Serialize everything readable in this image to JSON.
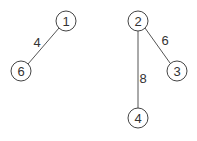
{
  "graph": {
    "nodes": [
      {
        "id": "1",
        "label": "1",
        "x": 66,
        "y": 21
      },
      {
        "id": "6",
        "label": "6",
        "x": 21,
        "y": 71
      },
      {
        "id": "2",
        "label": "2",
        "x": 138,
        "y": 21
      },
      {
        "id": "3",
        "label": "3",
        "x": 177,
        "y": 71
      },
      {
        "id": "4",
        "label": "4",
        "x": 138,
        "y": 118
      }
    ],
    "edges": [
      {
        "from": "1",
        "to": "6",
        "weight": "4",
        "lx": 37,
        "ly": 42
      },
      {
        "from": "2",
        "to": "3",
        "weight": "6",
        "lx": 165,
        "ly": 40
      },
      {
        "from": "2",
        "to": "4",
        "weight": "8",
        "lx": 143,
        "ly": 78
      }
    ]
  }
}
